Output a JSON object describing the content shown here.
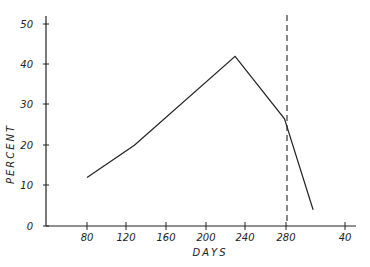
{
  "chart_data": {
    "type": "line",
    "title": "",
    "xlabel": "DAYS",
    "ylabel": "PERCENT",
    "x_ticks": [
      "80",
      "120",
      "160",
      "200",
      "240",
      "280",
      "40"
    ],
    "y_ticks": [
      "0",
      "10",
      "20",
      "30",
      "40",
      "50"
    ],
    "xlim": [
      40,
      340
    ],
    "ylim": [
      0,
      50
    ],
    "grid": false,
    "legend": null,
    "series": [
      {
        "name": "percent",
        "x": [
          80,
          128,
          230,
          280,
          309
        ],
        "y": [
          12,
          20,
          42,
          26.5,
          4
        ]
      }
    ],
    "annotations": [
      {
        "type": "vertical-dashed-line",
        "x": 280
      }
    ]
  },
  "axes": {
    "xlabel": "DAYS",
    "ylabel": "PERCENT",
    "x_ticks": [
      {
        "label": "80",
        "px": 87
      },
      {
        "label": "120",
        "px": 126
      },
      {
        "label": "160",
        "px": 166
      },
      {
        "label": "200",
        "px": 206
      },
      {
        "label": "240",
        "px": 245
      },
      {
        "label": "280",
        "px": 286
      },
      {
        "label": "40",
        "px": 345
      }
    ],
    "y_ticks": [
      {
        "label": "0",
        "py": 226
      },
      {
        "label": "10",
        "py": 185
      },
      {
        "label": "20",
        "py": 145
      },
      {
        "label": "30",
        "py": 104
      },
      {
        "label": "40",
        "py": 64
      },
      {
        "label": "50",
        "py": 24
      }
    ]
  },
  "colors": {
    "line": "#222222",
    "dashed": "#555555",
    "axis": "#222222"
  }
}
